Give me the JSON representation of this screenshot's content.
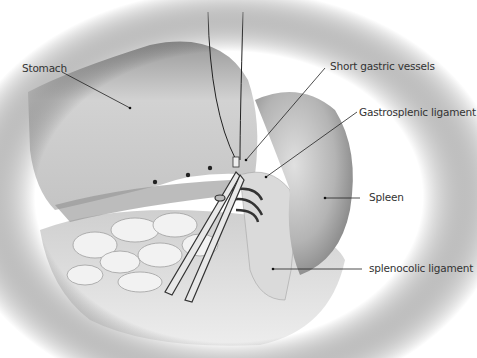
{
  "figure": {
    "colors": {
      "background": "#ffffff",
      "tissue_light": "#e6e6e6",
      "tissue_mid": "#b8b8b8",
      "tissue_dark": "#7a7a7a",
      "leader_line": "#222222",
      "label_text": "#333333"
    }
  },
  "labels": {
    "stomach": "Stomach",
    "short_gastric": "Short gastric vessels",
    "gastrosplenic": "Gastrosplenic ligament",
    "spleen": "Spleen",
    "splenocolic": "splenocolic ligament"
  }
}
